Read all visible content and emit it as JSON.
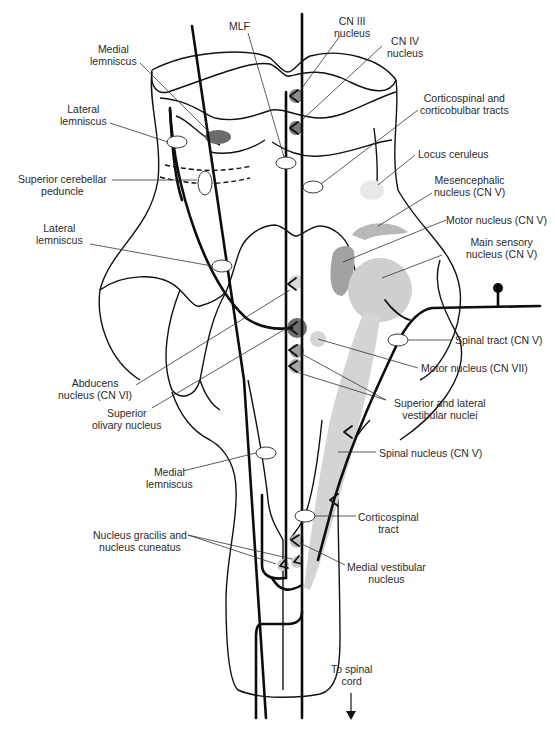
{
  "figure": {
    "colors": {
      "line": "#111111",
      "dark_nucleus": "#6b6b6b",
      "mid_nucleus": "#a8a8a8",
      "light_nucleus": "#d4d4d4",
      "pale_nucleus": "#e6e6e6"
    }
  },
  "labels": {
    "mlf": "MLF",
    "cn3_nucleus": [
      "CN III",
      "nucleus"
    ],
    "cn4_nucleus": [
      "CN IV",
      "nucleus"
    ],
    "medial_lemniscus_top": [
      "Medial",
      "lemniscus"
    ],
    "lateral_lemniscus_top": [
      "Lateral",
      "lemniscus"
    ],
    "superior_cerebellar_peduncle": [
      "Superior cerebellar",
      "peduncle"
    ],
    "lateral_lemniscus_mid": [
      "Lateral",
      "lemniscus"
    ],
    "corticospinal_corticobulbar": [
      "Corticospinal and",
      "corticobulbar tracts"
    ],
    "locus_ceruleus": "Locus ceruleus",
    "mesencephalic_nucleus": [
      "Mesencephalic",
      "nucleus (CN V)"
    ],
    "motor_nucleus_cn5": "Motor nucleus (CN V)",
    "main_sensory_nucleus": [
      "Main sensory",
      "nucleus (CN V)"
    ],
    "spinal_tract_cn5": "Spinal tract (CN V)",
    "motor_nucleus_cn7": "Motor nucleus (CN VII)",
    "abducens_nucleus": [
      "Abducens",
      "nucleus (CN VI)"
    ],
    "superior_olivary_nucleus": [
      "Superior",
      "olivary nucleus"
    ],
    "superior_lateral_vestibular": [
      "Superior and lateral",
      "vestibular nuclei"
    ],
    "spinal_nucleus_cn5": "Spinal nucleus (CN V)",
    "medial_lemniscus_bottom": [
      "Medial",
      "lemniscus"
    ],
    "corticospinal_tract": [
      "Corticospinal",
      "tract"
    ],
    "gracilis_cuneatus": [
      "Nucleus gracilis and",
      "nucleus cuneatus"
    ],
    "medial_vestibular_nucleus": [
      "Medial vestibular",
      "nucleus"
    ],
    "to_spinal_cord": [
      "To spinal",
      "cord"
    ]
  },
  "icons": {
    "down_arrow": "↓"
  }
}
